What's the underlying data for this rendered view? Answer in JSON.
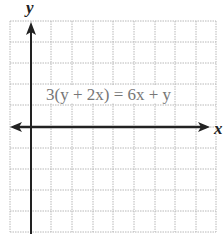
{
  "graph": {
    "x_axis_label": "x",
    "y_axis_label": "y",
    "equation": "3(y + 2x) = 6x + y",
    "grid": {
      "columns": 10,
      "rows": 10,
      "x_lines_px": [
        10,
        31,
        51,
        72,
        93,
        113,
        134,
        155,
        175,
        196,
        216
      ],
      "y_lines_px": [
        21,
        42,
        63,
        84,
        105,
        127,
        148,
        169,
        190,
        211,
        232
      ],
      "y_axis_px": 31,
      "x_axis_px": 127,
      "grid_color": "#b8b8b8",
      "axis_color": "#222222"
    }
  }
}
